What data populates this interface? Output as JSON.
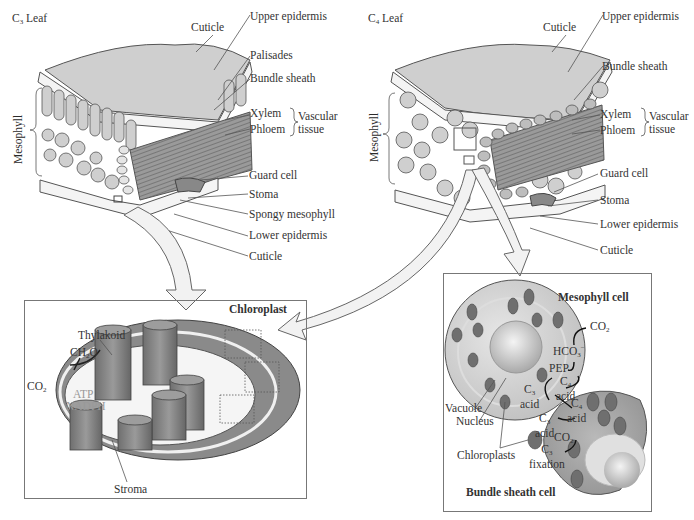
{
  "c3_leaf": {
    "title": "C3 Leaf",
    "title_main": "C",
    "title_sub": "3",
    "title_rest": " Leaf",
    "side_label": "Mesophyll",
    "labels": {
      "cuticle_top": "Cuticle",
      "upper_epidermis": "Upper epidermis",
      "palisades": "Palisades",
      "bundle_sheath": "Bundle sheath",
      "xylem": "Xylem",
      "phloem": "Phloem",
      "vascular_tissue_1": "Vascular",
      "vascular_tissue_2": "tissue",
      "guard_cell": "Guard cell",
      "stoma": "Stoma",
      "spongy_mesophyll": "Spongy mesophyll",
      "lower_epidermis": "Lower epidermis",
      "cuticle_bottom": "Cuticle"
    }
  },
  "c4_leaf": {
    "title_main": "C",
    "title_sub": "4",
    "title_rest": " Leaf",
    "side_label": "Mesophyll",
    "labels": {
      "cuticle_top": "Cuticle",
      "upper_epidermis": "Upper epidermis",
      "bundle_sheath": "Bundle sheath",
      "xylem": "Xylem",
      "phloem": "Phloem",
      "vascular_tissue_1": "Vascular",
      "vascular_tissue_2": "tissue",
      "guard_cell": "Guard cell",
      "stoma": "Stoma",
      "lower_epidermis": "Lower epidermis",
      "cuticle_bottom": "Cuticle"
    }
  },
  "chloroplast_panel": {
    "title": "Chloroplast",
    "thylakoid": "Thylakoid",
    "ch2o_main": "CH",
    "ch2o_sub": "2",
    "ch2o_rest": "O",
    "co2_main": "CO",
    "co2_sub": "2",
    "atp": "ATP",
    "nadph": "NADPH",
    "stroma": "Stroma"
  },
  "c4_cell_panel": {
    "mesophyll_cell": "Mesophyll cell",
    "bundle_sheath_cell": "Bundle sheath cell",
    "co2_in_main": "CO",
    "co2_in_sub": "2",
    "hco3_main": "HCO",
    "hco3_sub": "3",
    "hco3_sup": "−",
    "pep": "PEP",
    "c4_acid_a_main": "C",
    "c4_acid_a_sub": "4",
    "acid": "acid",
    "c3_acid_sub": "3",
    "c4_acid_sub": "4",
    "co2_release_main": "CO",
    "co2_release_sub": "2",
    "c3_fixation_sub": "3",
    "fixation": "fixation",
    "vacuole": "Vacuole",
    "nucleus": "Nucleus",
    "chloroplasts": "Chloroplasts"
  },
  "colors": {
    "tissue_fill": "#c9c9c9",
    "dark_tissue": "#8e8e8e",
    "chloroplast_fill": "#7a7a7a",
    "outline": "#444444",
    "arrow_fill": "#f0f0f0",
    "panel_border": "#777777"
  }
}
